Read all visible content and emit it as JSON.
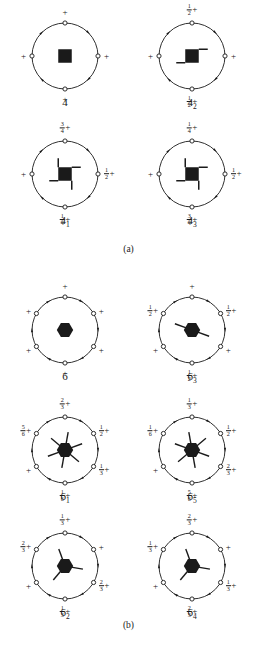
{
  "figure": {
    "sections": [
      {
        "id": "a",
        "caption": "(a)"
      },
      {
        "id": "b",
        "caption": "(b)"
      }
    ]
  },
  "diagrams": [
    {
      "name": "4",
      "label": "4",
      "label_base": "4",
      "label_sub": "",
      "order": 4,
      "center_symbol": "filled-square",
      "tails": 0,
      "rotation_arrows": 4,
      "heights": [
        {
          "position": "top",
          "frac": "",
          "sign": "+"
        },
        {
          "position": "right",
          "frac": "",
          "sign": "+"
        },
        {
          "position": "bottom",
          "frac": "",
          "sign": "+"
        },
        {
          "position": "left",
          "frac": "",
          "sign": "+"
        }
      ]
    },
    {
      "name": "4_2",
      "label": "4₂",
      "label_base": "4",
      "label_sub": "2",
      "order": 4,
      "center_symbol": "filled-square-two-tails",
      "tails": 2,
      "rotation_arrows": 4,
      "heights": [
        {
          "position": "top",
          "frac": "1/2",
          "sign": "+"
        },
        {
          "position": "right",
          "frac": "",
          "sign": "+"
        },
        {
          "position": "bottom",
          "frac": "1/2",
          "sign": "+"
        },
        {
          "position": "left",
          "frac": "",
          "sign": "+"
        }
      ]
    },
    {
      "name": "4_1",
      "label": "4₁",
      "label_base": "4",
      "label_sub": "1",
      "order": 4,
      "center_symbol": "filled-square-four-tails-cw",
      "tails": 4,
      "rotation_arrows": 4,
      "heights": [
        {
          "position": "top",
          "frac": "3/4",
          "sign": "+"
        },
        {
          "position": "right",
          "frac": "1/2",
          "sign": "+"
        },
        {
          "position": "bottom",
          "frac": "1/4",
          "sign": "+"
        },
        {
          "position": "left",
          "frac": "",
          "sign": "+"
        }
      ]
    },
    {
      "name": "4_3",
      "label": "4₃",
      "label_base": "4",
      "label_sub": "3",
      "order": 4,
      "center_symbol": "filled-square-four-tails-ccw",
      "tails": 4,
      "rotation_arrows": 4,
      "heights": [
        {
          "position": "top",
          "frac": "1/4",
          "sign": "+"
        },
        {
          "position": "right",
          "frac": "1/2",
          "sign": "+"
        },
        {
          "position": "bottom",
          "frac": "3/4",
          "sign": "+"
        },
        {
          "position": "left",
          "frac": "",
          "sign": "+"
        }
      ]
    },
    {
      "name": "6",
      "label": "6",
      "label_base": "6",
      "label_sub": "",
      "order": 6,
      "center_symbol": "filled-hexagon",
      "tails": 0,
      "rotation_arrows": 6,
      "heights": [
        {
          "position": "top",
          "frac": "",
          "sign": "+"
        },
        {
          "position": "upper-right",
          "frac": "",
          "sign": "+"
        },
        {
          "position": "lower-right",
          "frac": "",
          "sign": "+"
        },
        {
          "position": "bottom",
          "frac": "",
          "sign": "+"
        },
        {
          "position": "lower-left",
          "frac": "",
          "sign": "+"
        },
        {
          "position": "upper-left",
          "frac": "",
          "sign": "+"
        }
      ]
    },
    {
      "name": "6_3",
      "label": "6₃",
      "label_base": "6",
      "label_sub": "3",
      "order": 6,
      "center_symbol": "filled-hexagon-two-tails",
      "tails": 2,
      "rotation_arrows": 6,
      "heights": [
        {
          "position": "top",
          "frac": "",
          "sign": "+"
        },
        {
          "position": "upper-right",
          "frac": "1/2",
          "sign": "+"
        },
        {
          "position": "lower-right",
          "frac": "",
          "sign": "+"
        },
        {
          "position": "bottom",
          "frac": "1/2",
          "sign": "+"
        },
        {
          "position": "lower-left",
          "frac": "",
          "sign": "+"
        },
        {
          "position": "upper-left",
          "frac": "1/2",
          "sign": "+"
        }
      ]
    },
    {
      "name": "6_1",
      "label": "6₁",
      "label_base": "6",
      "label_sub": "1",
      "order": 6,
      "center_symbol": "filled-hexagon-six-tails-cw",
      "tails": 6,
      "rotation_arrows": 6,
      "heights": [
        {
          "position": "top",
          "frac": "2/3",
          "sign": "+"
        },
        {
          "position": "upper-right",
          "frac": "1/2",
          "sign": "+"
        },
        {
          "position": "lower-right",
          "frac": "1/3",
          "sign": "+"
        },
        {
          "position": "bottom",
          "frac": "1/6",
          "sign": "+"
        },
        {
          "position": "lower-left",
          "frac": "",
          "sign": "+"
        },
        {
          "position": "upper-left",
          "frac": "5/6",
          "sign": "+"
        }
      ]
    },
    {
      "name": "6_5",
      "label": "6₅",
      "label_base": "6",
      "label_sub": "5",
      "order": 6,
      "center_symbol": "filled-hexagon-six-tails-ccw",
      "tails": 6,
      "rotation_arrows": 6,
      "heights": [
        {
          "position": "top",
          "frac": "1/3",
          "sign": "+"
        },
        {
          "position": "upper-right",
          "frac": "1/2",
          "sign": "+"
        },
        {
          "position": "lower-right",
          "frac": "2/3",
          "sign": "+"
        },
        {
          "position": "bottom",
          "frac": "5/6",
          "sign": "+"
        },
        {
          "position": "lower-left",
          "frac": "",
          "sign": "+"
        },
        {
          "position": "upper-left",
          "frac": "1/6",
          "sign": "+"
        }
      ]
    },
    {
      "name": "6_2",
      "label": "6₂",
      "label_base": "6",
      "label_sub": "2",
      "order": 6,
      "center_symbol": "filled-hexagon-three-tails-cw",
      "tails": 3,
      "rotation_arrows": 6,
      "heights": [
        {
          "position": "top",
          "frac": "1/3",
          "sign": "+"
        },
        {
          "position": "upper-right",
          "frac": "",
          "sign": "+"
        },
        {
          "position": "lower-right",
          "frac": "2/3",
          "sign": "+"
        },
        {
          "position": "bottom",
          "frac": "1/3",
          "sign": "+"
        },
        {
          "position": "lower-left",
          "frac": "",
          "sign": "+"
        },
        {
          "position": "upper-left",
          "frac": "2/3",
          "sign": "+"
        }
      ]
    },
    {
      "name": "6_4",
      "label": "6₄",
      "label_base": "6",
      "label_sub": "4",
      "order": 6,
      "center_symbol": "filled-hexagon-three-tails-ccw",
      "tails": 3,
      "rotation_arrows": 6,
      "heights": [
        {
          "position": "top",
          "frac": "2/3",
          "sign": "+"
        },
        {
          "position": "upper-right",
          "frac": "",
          "sign": "+"
        },
        {
          "position": "lower-right",
          "frac": "1/3",
          "sign": "+"
        },
        {
          "position": "bottom",
          "frac": "2/3",
          "sign": "+"
        },
        {
          "position": "lower-left",
          "frac": "",
          "sign": "+"
        },
        {
          "position": "upper-left",
          "frac": "1/3",
          "sign": "+"
        }
      ]
    }
  ],
  "colors": {
    "ink": "#1a1a1a",
    "background": "#ffffff"
  }
}
